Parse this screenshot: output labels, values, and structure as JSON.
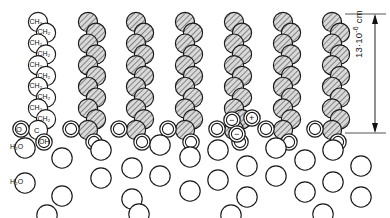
{
  "figure": {
    "dimension": {
      "value": "13",
      "separator": "·",
      "base": "10",
      "exponent": "-6",
      "unit": "cm",
      "full": "13·10⁻⁶ cm"
    },
    "colors": {
      "stroke": "#1a1a1a",
      "hatch_fill": "#d8d8d8",
      "hatch_line": "#2b2b2b",
      "water_fill": "#ffffff",
      "label_fill": "#ffffff",
      "background": "#ffffff"
    },
    "chain_count": 7,
    "labeled_chain_index": 0,
    "chain_labels": [
      "CH₃",
      "CH₂",
      "CH₂",
      "CH₂",
      "CH₂",
      "CH₂",
      "CH₂",
      "CH₂",
      "CH₂",
      "CH₂"
    ],
    "head_group": {
      "carbon": "C",
      "oxygen": "O",
      "hydroxyl": "OH"
    },
    "ions": {
      "negative": "−",
      "positive": "+"
    },
    "water_labels": [
      "H₂O",
      "H₂O"
    ]
  },
  "chart_data": {
    "type": "diagram",
    "annotations": [
      "13·10⁻⁶ cm"
    ],
    "species": [
      "CH₃",
      "CH₂",
      "C",
      "O",
      "OH",
      "H₂O",
      "−",
      "+"
    ],
    "layers": [
      {
        "name": "hydrocarbon tails",
        "count": 7,
        "label": "CH₂ / CH₃ chains"
      },
      {
        "name": "polar head groups",
        "label": "C, O, OH"
      },
      {
        "name": "aqueous subphase",
        "label": "H₂O"
      }
    ]
  }
}
